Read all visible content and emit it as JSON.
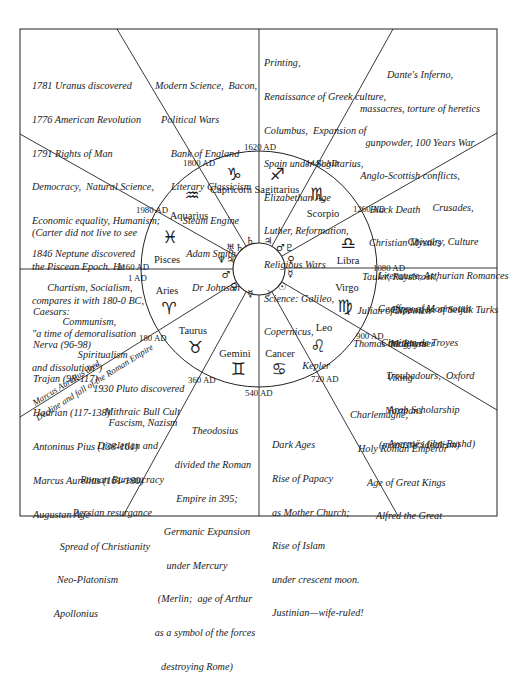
{
  "diagram": {
    "type": "astrological-ages-wheel",
    "signs": [
      {
        "name": "Capricorn",
        "glyph": "♑"
      },
      {
        "name": "Sagittarius",
        "glyph": "♐"
      },
      {
        "name": "Scorpio",
        "glyph": "♏"
      },
      {
        "name": "Libra",
        "glyph": "♎"
      },
      {
        "name": "Virgo",
        "glyph": "♍"
      },
      {
        "name": "Leo",
        "glyph": "♌"
      },
      {
        "name": "Cancer",
        "glyph": "♋"
      },
      {
        "name": "Gemini",
        "glyph": "♊"
      },
      {
        "name": "Taurus",
        "glyph": "♉"
      },
      {
        "name": "Aries",
        "glyph": "♈"
      },
      {
        "name": "Pisces",
        "glyph": "♓"
      },
      {
        "name": "Aquarius",
        "glyph": "♒"
      }
    ],
    "dates": {
      "d1620": "1620 AD",
      "d1440": "1440 AD",
      "d1260": "1260 AD",
      "d1080": "1080 AD",
      "d900": "900 AD",
      "d720": "720 AD",
      "d540": "540 AD",
      "d360": "360 AD",
      "d180": "180 AD",
      "d1": "1 AD",
      "d2160": "2160 AD",
      "d1980": "1980 AD",
      "d1800": "1800 AD"
    },
    "rulers": {
      "capricorn": "♄",
      "sagittarius": "♃",
      "scorpio": "♂♇",
      "libra": "♀",
      "virgo": "☿",
      "leo": "☉",
      "cancer": "☽",
      "gemini": "☿",
      "taurus": "♀",
      "aries": "♂",
      "pisces": "♆♃",
      "aquarius": "♅♄"
    },
    "diagonal_note": {
      "line1": "Marcus Aurelius died",
      "line2": "Decline and fall of the Roman Empire"
    }
  },
  "eras": {
    "aquarius_age": [
      "1781 Uranus discovered",
      "1776 American Revolution",
      "1791 Rights of Man",
      "Democracy,  Natural Science,",
      "Economic equality, Humanism;",
      "1846 Neptune discovered",
      "      Chartism, Socialism,",
      "            Communism,",
      "                  Spiritualism",
      "                        1930 Pluto discovered",
      "                              Fascism, Nazism"
    ],
    "capricorn_age": [
      "Modern Science,  Bacon,",
      "Political Wars",
      "Bank of England",
      "Literary Classicism",
      "Steam Engine",
      "Adam Smith",
      "Dr Johnson"
    ],
    "sagittarius_age": [
      "Printing,",
      "Renaissance of Greek culture,",
      "Columbus,  Expansion of",
      "Spain under Sagittarius,",
      "Elizabethan Age",
      "Luther, Reformation,",
      "Religious Wars",
      "Science: Galileo,",
      "Copernicus,",
      "               Kepler"
    ],
    "scorpio_age": [
      "Dante's Inferno,",
      "massacres, torture of heretics",
      "gunpowder, 100 Years War",
      "Anglo-Scottish conflicts,",
      "Black Death",
      "Christian Mystics",
      "Tauler, Ruysbroek,",
      "Julian of Norwich",
      "Thomas the Rhymer"
    ],
    "libra_age": [
      "Crusades,",
      "Chivalry, Culture",
      "Literature, Arthurian Romances",
      "Geoffrey of Monmouth",
      "Chrétien de Troyes",
      "Troubadours,  Oxford",
      "Arab Scholarship",
      "Averroës (ibn-Rushd)"
    ],
    "virgo_age": [
      "Expansion of Seljuk Turks",
      "Magyars",
      "Viking",
      "Normans",
      "(monastic idealism)"
    ],
    "leo_age": [
      "Charlemagne,",
      "Holy Roman Emperor",
      "Age of Great Kings",
      "Alfred the Great"
    ],
    "cancer_age": [
      "Dark Ages",
      "Rise of Papacy",
      "as Mother Church;",
      "Rise of Islam",
      "under crescent moon.",
      "Justinian—wife-ruled!"
    ],
    "gemini_age": [
      "Theodosius",
      "divided the Roman",
      "Empire in 395;",
      "Germanic Expansion",
      "under Mercury",
      "(Merlin;  age of Arthur",
      "as a symbol of the forces",
      "destroying Rome)"
    ],
    "taurus_age": [
      "Mithraic Bull Cult",
      "Diocletian and",
      "Roman Bureaucracy",
      "Persian resurgance",
      "Spread of Christianity",
      "Neo-Platonism",
      "Apollonius"
    ],
    "aries_age": [
      "Caesars:",
      "Nerva (96-98)",
      "Trajan (98-117)",
      "Hadrian (117-138)",
      "Antoninus Pius (138-161)",
      "Marcus Aurelius (161-180)",
      "Augustan Age"
    ],
    "pisces_age": [
      "(Carter did not live to see",
      "the Piscean Epoch. He",
      "compares it with 180-0 BC,",
      "\"a time of demoralisation",
      "and dissolution\")"
    ]
  }
}
